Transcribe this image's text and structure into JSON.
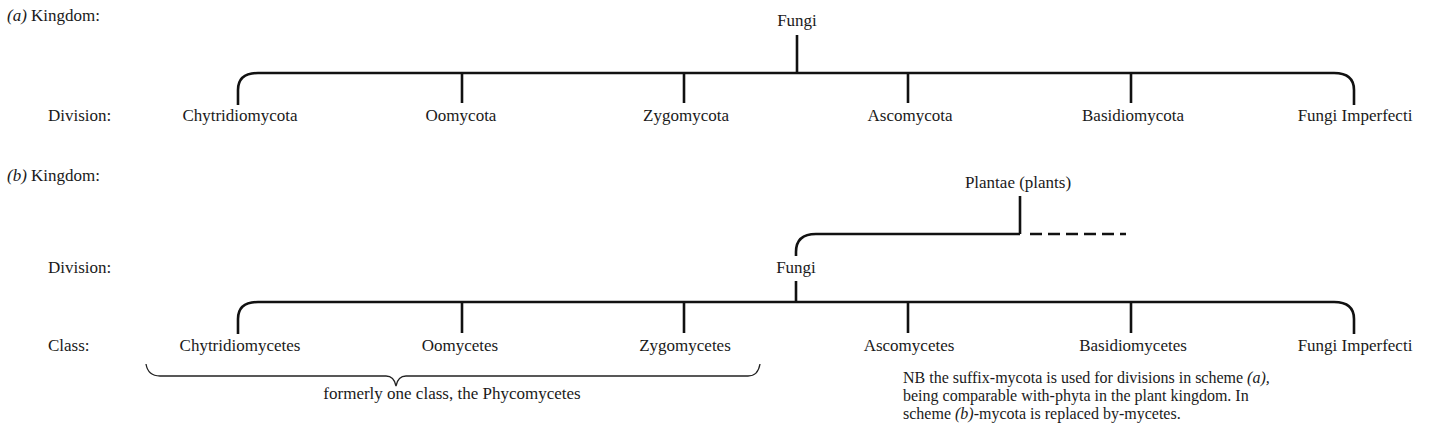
{
  "scheme_a": {
    "label_prefix": "(a)",
    "kingdom_label": "Kingdom:",
    "division_label": "Division:",
    "kingdom": "Fungi",
    "divisions": [
      "Chytridiomycota",
      "Oomycota",
      "Zygomycota",
      "Ascomycota",
      "Basidiomycota",
      "Fungi Imperfecti"
    ]
  },
  "scheme_b": {
    "label_prefix": "(b)",
    "kingdom_label": "Kingdom:",
    "division_label": "Division:",
    "class_label": "Class:",
    "kingdom": "Plantae (plants)",
    "division": "Fungi",
    "classes": [
      "Chytridiomycetes",
      "Oomycetes",
      "Zygomycetes",
      "Ascomycetes",
      "Basidiomycetes",
      "Fungi Imperfecti"
    ],
    "brace_caption": "formerly one class, the Phycomycetes"
  },
  "note": {
    "line1_a": "NB the suffix-mycota is used for divisions in scheme ",
    "line1_b": "(a),",
    "line2": "being comparable with-phyta in the plant kingdom. In",
    "line3_a": "scheme ",
    "line3_b": "(b)",
    "line3_c": "-mycota is replaced by-mycetes."
  }
}
